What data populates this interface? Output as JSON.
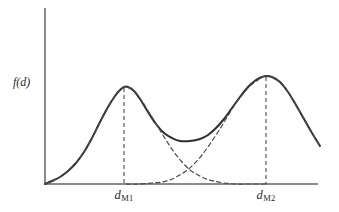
{
  "figure": {
    "title": "",
    "background_color": "#fefefe",
    "curve_color": "#2f2f2f",
    "axis_color": "#8a8a8a"
  },
  "axes": {
    "ylabel": "f(d)",
    "xlabel": "",
    "origin": {
      "x": 45,
      "y": 184
    },
    "x_axis_end": 318,
    "y_axis_top": 8
  },
  "xticks": [
    {
      "id": "tick-1",
      "base": "d",
      "subscript": "M1",
      "x": 124
    },
    {
      "id": "tick-2",
      "base": "d",
      "subscript": "M2",
      "x": 266
    }
  ],
  "chart_data": {
    "type": "line",
    "title": "",
    "xlabel": "",
    "ylabel": "f(d)",
    "grid": false,
    "legend": null,
    "xlim": [
      0,
      1
    ],
    "ylim": [
      0,
      1
    ],
    "annotations": [
      {
        "text": "d_M1",
        "x_px": 124,
        "y_px": 189,
        "kind": "x-tick-label"
      },
      {
        "text": "d_M2",
        "x_px": 266,
        "y_px": 189,
        "kind": "x-tick-label"
      }
    ],
    "series": [
      {
        "name": "mixture (solid)",
        "style": "solid",
        "color": "#2f2f2f",
        "width": 2.0,
        "points_px": [
          [
            45,
            184
          ],
          [
            52,
            181
          ],
          [
            60,
            177
          ],
          [
            68,
            171
          ],
          [
            76,
            163
          ],
          [
            84,
            152
          ],
          [
            92,
            138
          ],
          [
            100,
            122
          ],
          [
            108,
            107
          ],
          [
            115,
            96
          ],
          [
            120,
            90
          ],
          [
            124,
            87
          ],
          [
            128,
            87
          ],
          [
            134,
            91
          ],
          [
            140,
            99
          ],
          [
            148,
            112
          ],
          [
            156,
            124
          ],
          [
            164,
            133
          ],
          [
            172,
            138
          ],
          [
            180,
            141
          ],
          [
            190,
            141
          ],
          [
            200,
            139
          ],
          [
            208,
            135
          ],
          [
            216,
            128
          ],
          [
            224,
            119
          ],
          [
            232,
            108
          ],
          [
            240,
            97
          ],
          [
            248,
            87
          ],
          [
            256,
            80
          ],
          [
            262,
            77
          ],
          [
            266,
            76
          ],
          [
            272,
            77
          ],
          [
            280,
            82
          ],
          [
            288,
            92
          ],
          [
            296,
            105
          ],
          [
            304,
            119
          ],
          [
            312,
            133
          ],
          [
            320,
            146
          ]
        ]
      },
      {
        "name": "component 1 (dashed)",
        "style": "dashed",
        "color": "#4a4a4a",
        "width": 1.2,
        "points_px": [
          [
            45,
            184
          ],
          [
            52,
            181
          ],
          [
            60,
            177
          ],
          [
            68,
            171
          ],
          [
            76,
            163
          ],
          [
            84,
            152
          ],
          [
            92,
            138
          ],
          [
            100,
            122
          ],
          [
            108,
            107
          ],
          [
            115,
            96
          ],
          [
            120,
            90
          ],
          [
            124,
            87
          ],
          [
            128,
            87
          ],
          [
            134,
            91
          ],
          [
            142,
            101
          ],
          [
            150,
            114
          ],
          [
            158,
            127
          ],
          [
            166,
            140
          ],
          [
            174,
            152
          ],
          [
            182,
            162
          ],
          [
            190,
            170
          ],
          [
            198,
            175
          ],
          [
            206,
            179
          ],
          [
            214,
            181
          ],
          [
            224,
            183
          ],
          [
            236,
            184
          ],
          [
            250,
            184
          ],
          [
            268,
            184
          ]
        ]
      },
      {
        "name": "component 2 (dashed)",
        "style": "dashed",
        "color": "#4a4a4a",
        "width": 1.2,
        "points_px": [
          [
            126,
            184
          ],
          [
            140,
            184
          ],
          [
            152,
            183
          ],
          [
            162,
            182
          ],
          [
            170,
            180
          ],
          [
            178,
            176
          ],
          [
            186,
            171
          ],
          [
            194,
            164
          ],
          [
            202,
            155
          ],
          [
            210,
            144
          ],
          [
            218,
            132
          ],
          [
            226,
            119
          ],
          [
            234,
            106
          ],
          [
            242,
            95
          ],
          [
            250,
            86
          ],
          [
            258,
            80
          ],
          [
            262,
            77
          ],
          [
            266,
            76
          ],
          [
            272,
            77
          ],
          [
            280,
            82
          ],
          [
            288,
            92
          ],
          [
            296,
            105
          ],
          [
            304,
            119
          ],
          [
            312,
            133
          ],
          [
            320,
            146
          ]
        ]
      }
    ],
    "droplines": [
      {
        "name": "dropline-dM1",
        "x_px": 124,
        "y_top_px": 88,
        "y_bottom_px": 184
      },
      {
        "name": "dropline-dM2",
        "x_px": 266,
        "y_top_px": 77,
        "y_bottom_px": 184
      }
    ]
  }
}
